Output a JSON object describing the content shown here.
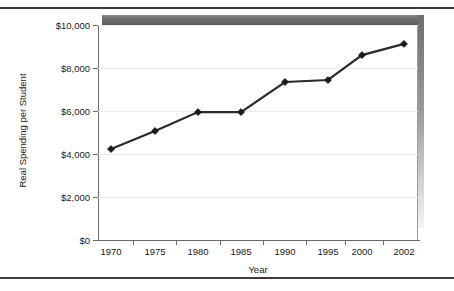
{
  "chart_data": {
    "type": "line",
    "title": "",
    "xlabel": "Year",
    "ylabel": "Real Spending per Student",
    "categories": [
      "1970",
      "1975",
      "1980",
      "1985",
      "1990",
      "1995",
      "2000",
      "2002"
    ],
    "values": [
      4230,
      5070,
      5950,
      5950,
      7350,
      7440,
      8600,
      9120
    ],
    "series": [
      {
        "name": "Real Spending per Student",
        "values": [
          4230,
          5070,
          5950,
          5950,
          7350,
          7440,
          8600,
          9120
        ]
      }
    ],
    "ylim": [
      0,
      10000
    ],
    "ytick_values": [
      0,
      2000,
      4000,
      6000,
      8000,
      10000
    ],
    "ytick_labels": [
      "$0",
      "$2,000",
      "$4,000",
      "$6,000",
      "$8,000",
      "$10,000"
    ],
    "xtick_labels": [
      "1970",
      "1975",
      "1980",
      "1985",
      "1990",
      "1995",
      "2000",
      "2002"
    ],
    "grid": true,
    "grid_axis": "y",
    "legend": false,
    "legend_position": "none",
    "marker": "diamond",
    "line_color": "#2b2b2b",
    "marker_color": "#1a1a1a",
    "grid_color": "#ebebeb",
    "axis_color": "#6b6b6b",
    "plot_background": "#ffffff",
    "frame_color": "#3a3a3a",
    "slab_color": "#5d5d5d"
  }
}
